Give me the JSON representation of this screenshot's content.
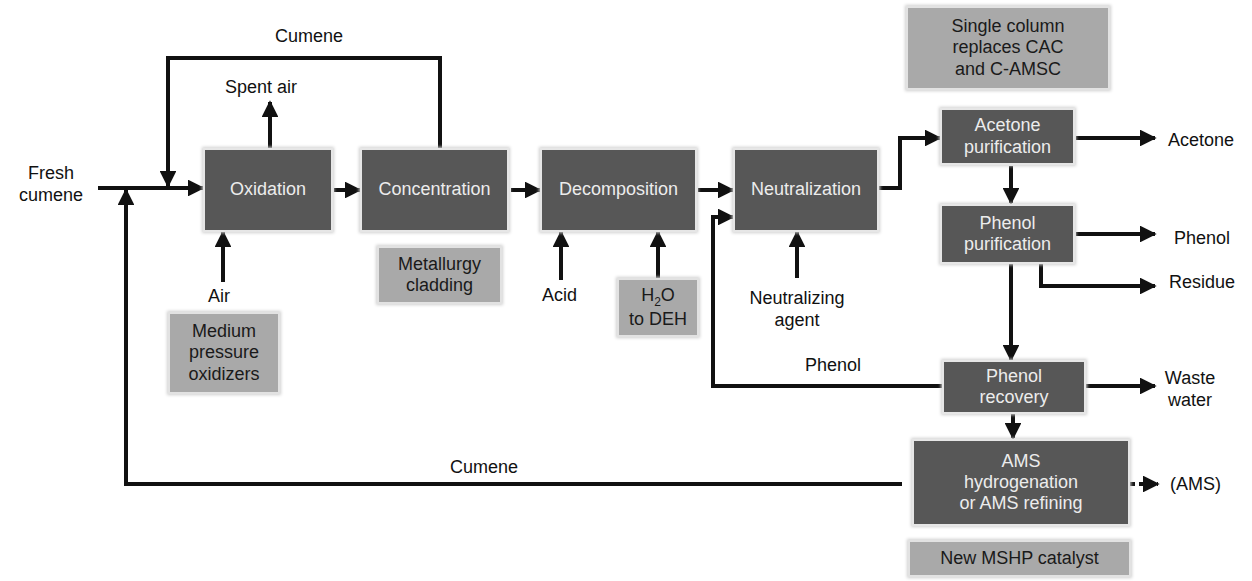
{
  "diagram": {
    "type": "process-flow",
    "colors": {
      "process_box": "#575757",
      "note_box": "#a9a9a9",
      "line": "#111111",
      "background": "#ffffff"
    },
    "process_units": [
      {
        "id": "oxidation",
        "label": "Oxidation"
      },
      {
        "id": "concentration",
        "label": "Concentration"
      },
      {
        "id": "decomposition",
        "label": "Decomposition"
      },
      {
        "id": "neutralization",
        "label": "Neutralization"
      },
      {
        "id": "acetone_purification",
        "line1": "Acetone",
        "line2": "purification"
      },
      {
        "id": "phenol_purification",
        "line1": "Phenol",
        "line2": "purification"
      },
      {
        "id": "phenol_recovery",
        "line1": "Phenol",
        "line2": "recovery"
      },
      {
        "id": "ams",
        "line1": "AMS",
        "line2": "hydrogenation",
        "line3": "or AMS refining"
      }
    ],
    "notes": {
      "single_column": {
        "line1": "Single column",
        "line2": "replaces CAC",
        "line3": "and C-AMSC"
      },
      "metallurgy": {
        "line1": "Metallurgy",
        "line2": "cladding"
      },
      "medium_pressure": {
        "line1": "Medium",
        "line2": "pressure",
        "line3": "oxidizers"
      },
      "h2o": {
        "h": "H",
        "sub": "2",
        "o": "O",
        "line2": "to DEH"
      },
      "mshp": {
        "label": "New MSHP catalyst"
      }
    },
    "streams": {
      "fresh_cumene": {
        "line1": "Fresh",
        "line2": "cumene"
      },
      "cumene_recycle_top": "Cumene",
      "spent_air": "Spent air",
      "air": "Air",
      "acid": "Acid",
      "neutralizing_agent": {
        "line1": "Neutralizing",
        "line2": "agent"
      },
      "phenol_recycle": "Phenol",
      "cumene_recycle_bottom": "Cumene",
      "acetone_out": "Acetone",
      "phenol_out": "Phenol",
      "residue_out": "Residue",
      "waste_water": {
        "line1": "Waste",
        "line2": "water"
      },
      "ams_out": "(AMS)"
    }
  }
}
